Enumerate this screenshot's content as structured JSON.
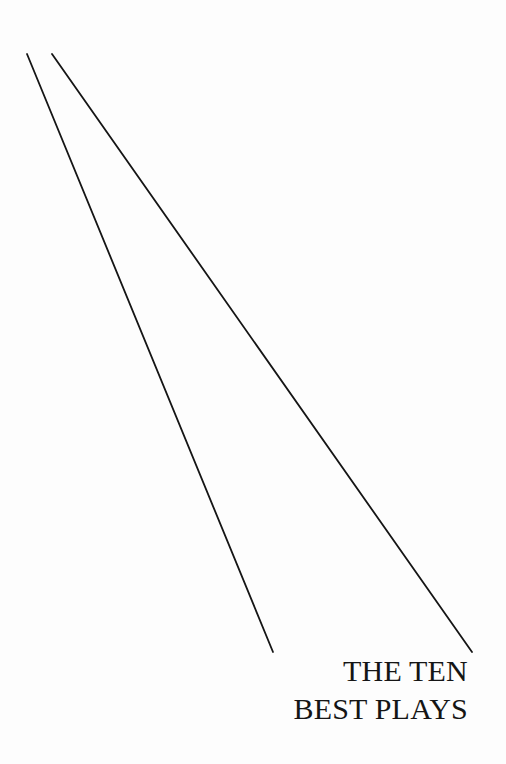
{
  "page": {
    "background": "#fdfdfd",
    "ink_color": "#151515"
  },
  "title": {
    "line1": "THE TEN",
    "line2": "BEST PLAYS"
  },
  "decoration": {
    "lines": [
      {
        "x1": 27,
        "y1": 54,
        "x2": 273,
        "y2": 652
      },
      {
        "x1": 52,
        "y1": 54,
        "x2": 472,
        "y2": 652
      }
    ]
  }
}
